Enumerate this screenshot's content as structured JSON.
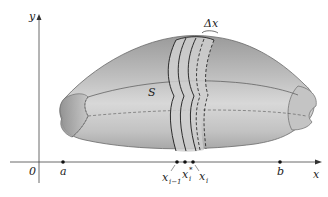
{
  "figure": {
    "axes": {
      "x_label": "x",
      "y_label": "y",
      "origin_label": "0"
    },
    "points": [
      {
        "label": "a",
        "x": 63
      },
      {
        "label": "x",
        "sub": "i−1",
        "x": 177
      },
      {
        "label": "x",
        "sup": "*",
        "sub": "i",
        "x": 185
      },
      {
        "label": "x",
        "sub": "i",
        "x": 193
      },
      {
        "label": "b",
        "x": 280
      }
    ],
    "labels": {
      "solid": "S",
      "delta_x": "Δx"
    },
    "colors": {
      "solid_fill": "#b8b8b8",
      "solid_dark": "#8e8e8e",
      "solid_light": "#d6d6d6",
      "slab_fill": "#c9c9c9",
      "outline": "#555555",
      "axis": "#444444",
      "slab_line": "#1a1a1a"
    }
  }
}
